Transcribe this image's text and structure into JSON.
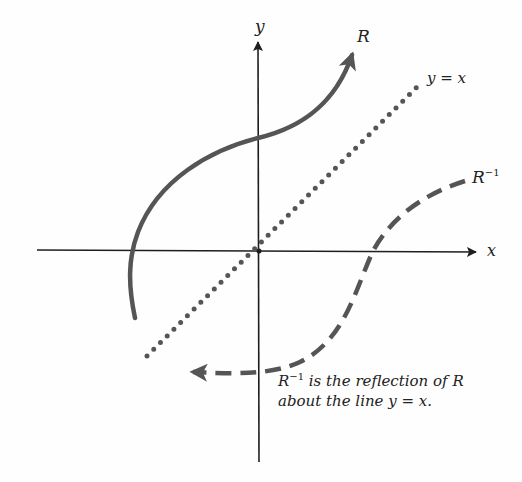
{
  "diagram": {
    "axes": {
      "x_label": "x",
      "y_label": "y"
    },
    "curves": [
      {
        "name": "R",
        "style": "solid",
        "label": "R"
      },
      {
        "name": "R-inverse",
        "style": "dashed",
        "label_base": "R",
        "label_sup": "−1"
      },
      {
        "name": "y=x",
        "style": "dotted",
        "label": "y = x"
      }
    ],
    "caption": {
      "line1_base": "R",
      "line1_sup": "−1",
      "line1_rest": " is the reflection of R",
      "line2": "about the line y = x."
    },
    "colors": {
      "axis": "#1e1e1e",
      "curve": "#555555",
      "text": "#222222"
    }
  }
}
